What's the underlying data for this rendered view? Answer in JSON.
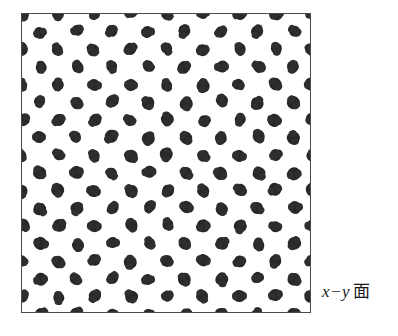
{
  "figure": {
    "name": "x-y plane particle distribution",
    "canvas": {
      "width": 398,
      "height": 336,
      "background": "#ffffff"
    },
    "label": {
      "axis_expression": "x−y",
      "plane_kanji": "面",
      "full_text": "x−y 面",
      "color": "#1a1a1a"
    },
    "frame": {
      "left": 21,
      "top": 13,
      "width": 290,
      "height": 300,
      "border_color": "#4a4a4a",
      "border_width": 1,
      "fill": "#ffffff"
    }
  },
  "chart_data": {
    "type": "scatter",
    "title": "",
    "subtitle": "",
    "xlabel": "x",
    "ylabel": "y",
    "annotations": [
      "x−y 面"
    ],
    "legend": [],
    "legend_position": "none",
    "grid": false,
    "axis_ticks": false,
    "xlim": [
      0,
      290
    ],
    "ylim": [
      0,
      300
    ],
    "marker": {
      "shape": "irregular-blob",
      "diameter_px": 12,
      "color": "#282828"
    },
    "lattice": {
      "description": "centered rectangular (staggered / hexagonal-like) lattice of dark blobs, clipped at all four frame edges",
      "column_pitch_px": 36.25,
      "row_pitch_px": 17.65,
      "row_offset_px": 18.125,
      "columns_per_even_row": 9,
      "columns_per_odd_row": 8,
      "row_count": 18,
      "total_markers": 155
    },
    "points": [
      {
        "row": 0,
        "parity": "even",
        "y": 0,
        "x": [
          0,
          36.25,
          72.5,
          108.75,
          145,
          181.25,
          217.5,
          253.75,
          290
        ]
      },
      {
        "row": 1,
        "parity": "odd",
        "y": 17.65,
        "x": [
          18.13,
          54.38,
          90.63,
          126.88,
          163.13,
          199.38,
          235.63,
          271.88
        ]
      },
      {
        "row": 2,
        "parity": "even",
        "y": 35.3,
        "x": [
          0,
          36.25,
          72.5,
          108.75,
          145,
          181.25,
          217.5,
          253.75,
          290
        ]
      },
      {
        "row": 3,
        "parity": "odd",
        "y": 52.95,
        "x": [
          18.13,
          54.38,
          90.63,
          126.88,
          163.13,
          199.38,
          235.63,
          271.88
        ]
      },
      {
        "row": 4,
        "parity": "even",
        "y": 70.6,
        "x": [
          0,
          36.25,
          72.5,
          108.75,
          145,
          181.25,
          217.5,
          253.75,
          290
        ]
      },
      {
        "row": 5,
        "parity": "odd",
        "y": 88.25,
        "x": [
          18.13,
          54.38,
          90.63,
          126.88,
          163.13,
          199.38,
          235.63,
          271.88
        ]
      },
      {
        "row": 6,
        "parity": "even",
        "y": 105.9,
        "x": [
          0,
          36.25,
          72.5,
          108.75,
          145,
          181.25,
          217.5,
          253.75,
          290
        ]
      },
      {
        "row": 7,
        "parity": "odd",
        "y": 123.55,
        "x": [
          18.13,
          54.38,
          90.63,
          126.88,
          163.13,
          199.38,
          235.63,
          271.88
        ]
      },
      {
        "row": 8,
        "parity": "even",
        "y": 141.2,
        "x": [
          0,
          36.25,
          72.5,
          108.75,
          145,
          181.25,
          217.5,
          253.75,
          290
        ]
      },
      {
        "row": 9,
        "parity": "odd",
        "y": 158.85,
        "x": [
          18.13,
          54.38,
          90.63,
          126.88,
          163.13,
          199.38,
          235.63,
          271.88
        ]
      },
      {
        "row": 10,
        "parity": "even",
        "y": 176.5,
        "x": [
          0,
          36.25,
          72.5,
          108.75,
          145,
          181.25,
          217.5,
          253.75,
          290
        ]
      },
      {
        "row": 11,
        "parity": "odd",
        "y": 194.15,
        "x": [
          18.13,
          54.38,
          90.63,
          126.88,
          163.13,
          199.38,
          235.63,
          271.88
        ]
      },
      {
        "row": 12,
        "parity": "even",
        "y": 211.8,
        "x": [
          0,
          36.25,
          72.5,
          108.75,
          145,
          181.25,
          217.5,
          253.75,
          290
        ]
      },
      {
        "row": 13,
        "parity": "odd",
        "y": 229.45,
        "x": [
          18.13,
          54.38,
          90.63,
          126.88,
          163.13,
          199.38,
          235.63,
          271.88
        ]
      },
      {
        "row": 14,
        "parity": "even",
        "y": 247.1,
        "x": [
          0,
          36.25,
          72.5,
          108.75,
          145,
          181.25,
          217.5,
          253.75,
          290
        ]
      },
      {
        "row": 15,
        "parity": "odd",
        "y": 264.75,
        "x": [
          18.13,
          54.38,
          90.63,
          126.88,
          163.13,
          199.38,
          235.63,
          271.88
        ]
      },
      {
        "row": 16,
        "parity": "even",
        "y": 282.4,
        "x": [
          0,
          36.25,
          72.5,
          108.75,
          145,
          181.25,
          217.5,
          253.75,
          290
        ]
      },
      {
        "row": 17,
        "parity": "odd",
        "y": 300.05,
        "x": [
          18.13,
          54.38,
          90.63,
          126.88,
          163.13,
          199.38,
          235.63,
          271.88
        ]
      }
    ]
  }
}
